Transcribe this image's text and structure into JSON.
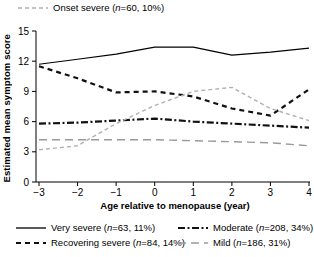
{
  "chart_data": {
    "type": "line",
    "title": "",
    "xlabel": "Age relative to menopause (year)",
    "ylabel": "Estimated mean symptom score",
    "xlim": [
      -3,
      4
    ],
    "ylim": [
      0,
      15
    ],
    "xticks": [
      -3,
      -2,
      -1,
      0,
      1,
      2,
      3,
      4
    ],
    "xtick_labels": [
      "−3",
      "−2",
      "−1",
      "0",
      "1",
      "2",
      "3",
      "4"
    ],
    "yticks": [
      0,
      3,
      6,
      9,
      12,
      15
    ],
    "ytick_labels": [
      "0",
      "3",
      "6",
      "9",
      "12",
      "15"
    ],
    "grid": false,
    "legend_position": "below-and-above",
    "x": [
      -3,
      -2,
      -1,
      0,
      1,
      2,
      3,
      4
    ],
    "series": [
      {
        "name": "Very severe",
        "n": 63,
        "percent": "11%",
        "label": "Very severe (n=63, 11%)",
        "line_style": "solid",
        "color": "#000000",
        "width": 1.1,
        "values": [
          11.7,
          12.2,
          12.7,
          13.4,
          13.4,
          12.6,
          12.9,
          13.3
        ]
      },
      {
        "name": "Recovering severe",
        "n": 84,
        "percent": "14%",
        "label": "Recovering severe (n=84, 14%)",
        "line_style": "dashed",
        "color": "#111111",
        "width": 2.2,
        "values": [
          11.5,
          10.3,
          8.9,
          9.0,
          8.5,
          7.3,
          6.6,
          9.2
        ]
      },
      {
        "name": "Moderate",
        "n": 208,
        "percent": "34%",
        "label": "Moderate (n=208, 34%)",
        "line_style": "dashdot",
        "color": "#111111",
        "width": 2.2,
        "values": [
          5.8,
          5.9,
          6.1,
          6.3,
          6.0,
          5.8,
          5.6,
          5.4
        ]
      },
      {
        "name": "Mild",
        "n": 186,
        "percent": "31%",
        "label": "Mild (n=186, 31%)",
        "line_style": "longdash",
        "color": "#9a9a9a",
        "width": 1.4,
        "values": [
          4.2,
          4.2,
          4.2,
          4.2,
          4.1,
          4.0,
          3.9,
          3.6
        ]
      },
      {
        "name": "Onset severe",
        "n": 60,
        "percent": "10%",
        "label": "Onset severe (n=60, 10%)",
        "line_style": "smalldash",
        "color": "#b0b0b0",
        "width": 1.4,
        "values": [
          3.2,
          3.6,
          5.8,
          7.6,
          9.0,
          9.4,
          7.3,
          6.1
        ]
      }
    ]
  },
  "top_legend": {
    "entry": {
      "name": "Onset severe",
      "text_plain": "Onset severe (n=60, 10%)",
      "prefix": "Onset severe (",
      "italic_n": "n",
      "suffix": "=60, 10%)"
    }
  },
  "bottom_legend": {
    "entries": [
      {
        "name": "Very severe",
        "text_plain": "Very severe (n=63, 11%)",
        "prefix": "Very severe (",
        "italic_n": "n",
        "suffix": "=63, 11%)"
      },
      {
        "name": "Moderate",
        "text_plain": "Moderate (n=208, 34%)",
        "prefix": "Moderate (",
        "italic_n": "n",
        "suffix": "=208, 34%)"
      },
      {
        "name": "Recovering severe",
        "text_plain": "Recovering severe (n=84, 14%)",
        "prefix": "Recovering severe (",
        "italic_n": "n",
        "suffix": "=84, 14%)"
      },
      {
        "name": "Mild",
        "text_plain": "Mild (n=186, 31%)",
        "prefix": "Mild (",
        "italic_n": "n",
        "suffix": "=186, 31%)"
      }
    ]
  },
  "axes": {
    "x_title": "Age relative to menopause (year)",
    "y_title": "Estimated mean symptom score"
  }
}
